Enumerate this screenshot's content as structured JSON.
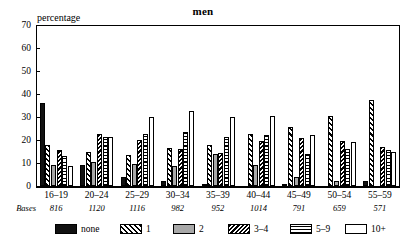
{
  "chart_data": {
    "type": "bar",
    "title": "men",
    "ylabel": "percentage",
    "xlabel": "",
    "ylim": [
      0,
      70
    ],
    "yticks": [
      0,
      10,
      20,
      30,
      40,
      50,
      60,
      70
    ],
    "grid": false,
    "legend_position": "bottom",
    "categories": [
      "16–19",
      "20–24",
      "25–29",
      "30–34",
      "35–39",
      "40–44",
      "45–49",
      "50–54",
      "55–59"
    ],
    "bases_label": "Bases",
    "bases": [
      "816",
      "1120",
      "1116",
      "982",
      "952",
      "1014",
      "791",
      "659",
      "571"
    ],
    "series": [
      {
        "name": "none",
        "pattern": "solid-black",
        "values": [
          36,
          9,
          4,
          2,
          0.5,
          0,
          1,
          0,
          2
        ]
      },
      {
        "name": "1",
        "pattern": "diagonal-hatch",
        "values": [
          18,
          15,
          13.5,
          16.5,
          18,
          22.5,
          25.5,
          30.5,
          37.5
        ]
      },
      {
        "name": "2",
        "pattern": "solid-gray",
        "values": [
          9,
          10.5,
          9.5,
          8.5,
          14,
          9,
          4,
          2,
          0
        ]
      },
      {
        "name": "3–4",
        "pattern": "dense-diagonal",
        "values": [
          15.5,
          22.5,
          20,
          16,
          14.5,
          19.5,
          21,
          19.5,
          17
        ]
      },
      {
        "name": "5–9",
        "pattern": "horizontal-lines",
        "values": [
          13,
          21.5,
          22.5,
          23.5,
          21.5,
          22,
          14,
          16,
          15.5
        ]
      },
      {
        "name": "10+",
        "pattern": "white",
        "values": [
          8.5,
          21.5,
          30,
          32.5,
          30,
          30.5,
          22,
          19,
          15
        ]
      }
    ]
  }
}
